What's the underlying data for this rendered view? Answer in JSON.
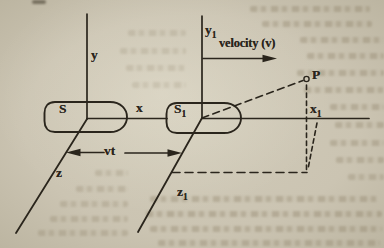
{
  "colors": {
    "ink": "#2a251c",
    "paper": "#cbc4b2"
  },
  "figure": {
    "frame_s": {
      "name": "S",
      "y_label": "y",
      "x_label": "x",
      "z_label": "z"
    },
    "frame_s1": {
      "name_main": "S",
      "name_sub": "1",
      "y_main": "y",
      "y_sub": "1",
      "x_main": "x",
      "x_sub": "1",
      "z_main": "z",
      "z_sub": "1"
    },
    "velocity_label": "velocity (v)",
    "separation_label": "vt",
    "point_label": "P"
  }
}
